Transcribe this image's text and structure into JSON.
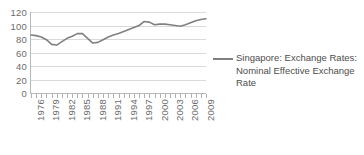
{
  "chart_data": {
    "type": "line",
    "title": "",
    "subtitle": "",
    "xlabel": "",
    "ylabel": "",
    "grid": true,
    "legend_position": "right",
    "series_color": "#808080",
    "ylim": [
      0,
      120
    ],
    "y_ticks": [
      120,
      100,
      80,
      60,
      40,
      20,
      0
    ],
    "xlim": [
      1976,
      2010
    ],
    "x_tick_labels": [
      "1976",
      "1979",
      "1982",
      "1985",
      "1988",
      "1991",
      "1994",
      "1997",
      "2000",
      "2003",
      "2006",
      "2009"
    ],
    "x_tick_label_step": 3,
    "x": [
      1976,
      1977,
      1978,
      1979,
      1980,
      1981,
      1982,
      1983,
      1984,
      1985,
      1986,
      1987,
      1988,
      1989,
      1990,
      1991,
      1992,
      1993,
      1994,
      1995,
      1996,
      1997,
      1998,
      1999,
      2000,
      2001,
      2002,
      2003,
      2004,
      2005,
      2006,
      2007,
      2008,
      2009,
      2010
    ],
    "series": [
      {
        "name": "Singapore: Exchange Rates: Nominal Effective Exchange Rate",
        "values": [
          86,
          85,
          83,
          79,
          72,
          71,
          76,
          81,
          84,
          88,
          88,
          81,
          74,
          75,
          79,
          83,
          86,
          88,
          91,
          94,
          97,
          100,
          106,
          105,
          101,
          102,
          102,
          101,
          100,
          99,
          101,
          104,
          107,
          109,
          110
        ]
      }
    ],
    "legend": [
      {
        "label": "Singapore: Exchange Rates: Nominal Effective Exchange Rate",
        "color": "#808080"
      }
    ]
  }
}
